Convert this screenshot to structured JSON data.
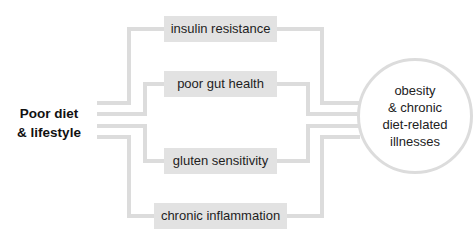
{
  "source": {
    "line1": "Poor diet",
    "line2": "& lifestyle"
  },
  "factors": [
    {
      "label": "insulin resistance"
    },
    {
      "label": "poor gut health"
    },
    {
      "label": "gluten sensitivity"
    },
    {
      "label": "chronic inflammation"
    }
  ],
  "outcome": {
    "line1": "obesity",
    "line2": "& chronic",
    "line3": "diet-related",
    "line4": "illnesses"
  },
  "colors": {
    "connector": "#dcdcdc",
    "box_fill": "#e2e2e2",
    "text": "#1e1e1e"
  }
}
